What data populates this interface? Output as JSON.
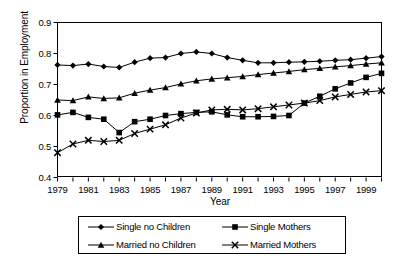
{
  "chart_data": {
    "type": "line",
    "title": "",
    "xlabel": "Year",
    "ylabel": "Proportion in Employment",
    "xlim": [
      1979,
      2000
    ],
    "ylim": [
      0.4,
      0.9
    ],
    "yticks": [
      "0.4",
      "0.5",
      "0.6",
      "0.7",
      "0.8",
      "0.9"
    ],
    "ytick_values": [
      0.4,
      0.5,
      0.6,
      0.7,
      0.8,
      0.9
    ],
    "xticks": [
      "1979",
      "1981",
      "1983",
      "1985",
      "1987",
      "1989",
      "1991",
      "1993",
      "1995",
      "1997",
      "1999"
    ],
    "xtick_values": [
      1979,
      1981,
      1983,
      1985,
      1987,
      1989,
      1991,
      1993,
      1995,
      1997,
      1999
    ],
    "x": [
      1979,
      1980,
      1981,
      1982,
      1983,
      1984,
      1985,
      1986,
      1987,
      1988,
      1989,
      1990,
      1991,
      1992,
      1993,
      1994,
      1995,
      1996,
      1997,
      1998,
      1999,
      2000
    ],
    "grid": false,
    "legend_position": "bottom",
    "series": [
      {
        "name": "Single no Children",
        "marker": "diamond",
        "color": "#000000",
        "values": [
          0.763,
          0.761,
          0.766,
          0.758,
          0.755,
          0.772,
          0.785,
          0.787,
          0.8,
          0.805,
          0.8,
          0.787,
          0.778,
          0.77,
          0.77,
          0.772,
          0.773,
          0.775,
          0.778,
          0.78,
          0.785,
          0.79
        ]
      },
      {
        "name": "Single Mothers",
        "marker": "square",
        "color": "#000000",
        "values": [
          0.602,
          0.61,
          0.594,
          0.588,
          0.545,
          0.58,
          0.588,
          0.6,
          0.606,
          0.61,
          0.612,
          0.602,
          0.596,
          0.596,
          0.597,
          0.6,
          0.64,
          0.662,
          0.686,
          0.705,
          0.723,
          0.736
        ]
      },
      {
        "name": "Married no Children",
        "marker": "triangle",
        "color": "#000000",
        "values": [
          0.65,
          0.648,
          0.66,
          0.655,
          0.657,
          0.672,
          0.682,
          0.69,
          0.702,
          0.712,
          0.718,
          0.722,
          0.726,
          0.732,
          0.737,
          0.742,
          0.748,
          0.752,
          0.757,
          0.761,
          0.766,
          0.77
        ]
      },
      {
        "name": "Married Mothers",
        "marker": "x",
        "color": "#000000",
        "values": [
          0.48,
          0.508,
          0.52,
          0.516,
          0.52,
          0.542,
          0.556,
          0.57,
          0.592,
          0.608,
          0.618,
          0.62,
          0.618,
          0.622,
          0.628,
          0.634,
          0.64,
          0.648,
          0.66,
          0.668,
          0.676,
          0.68
        ]
      }
    ]
  },
  "legend": {
    "items": [
      {
        "label": "Single no Children",
        "marker": "diamond"
      },
      {
        "label": "Single Mothers",
        "marker": "square"
      },
      {
        "label": "Married no Children",
        "marker": "triangle"
      },
      {
        "label": "Married Mothers",
        "marker": "x"
      }
    ]
  }
}
